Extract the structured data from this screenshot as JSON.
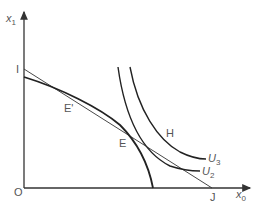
{
  "diagram": {
    "type": "indifference-curve / production frontier diagram",
    "axes": {
      "y_label": "x",
      "y_label_sub": "1",
      "x_label": "x",
      "x_label_sub": "0",
      "origin_label": "O"
    },
    "points": {
      "I": "I",
      "J": "J",
      "E_prime": "E'",
      "E": "E",
      "H": "H"
    },
    "curves": {
      "U3": {
        "label": "U",
        "sub": "3"
      },
      "U2": {
        "label": "U",
        "sub": "2"
      },
      "frontier": "concave production possibility frontier",
      "budget_line": "line I–J"
    },
    "colors": {
      "line": "#222222",
      "axis": "#333333",
      "text": "#555555",
      "background": "#ffffff"
    }
  }
}
